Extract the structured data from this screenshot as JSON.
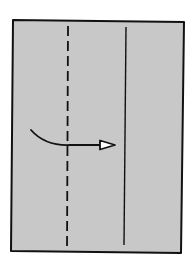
{
  "diagram": {
    "type": "origami-fold-step",
    "paper": {
      "fill": "#c8c8c8",
      "outline": "#111111",
      "corners": [
        [
          13,
          20
        ],
        [
          184,
          22
        ],
        [
          181,
          253
        ],
        [
          11,
          251
        ]
      ]
    },
    "lines": [
      {
        "kind": "valley-fold",
        "style": "dashed",
        "x1": 68,
        "y1": 26,
        "x2": 67,
        "y2": 251,
        "color": "#111111"
      },
      {
        "kind": "crease",
        "style": "solid",
        "x1": 126,
        "y1": 27,
        "x2": 124,
        "y2": 245,
        "color": "#111111"
      }
    ],
    "arrow": {
      "semantic": "fold-right-arrow",
      "start": [
        31,
        130
      ],
      "control": [
        45,
        146
      ],
      "end": [
        100,
        145
      ],
      "head_tip": [
        115,
        145
      ],
      "head_style": "open-triangle",
      "color": "#111111"
    }
  }
}
